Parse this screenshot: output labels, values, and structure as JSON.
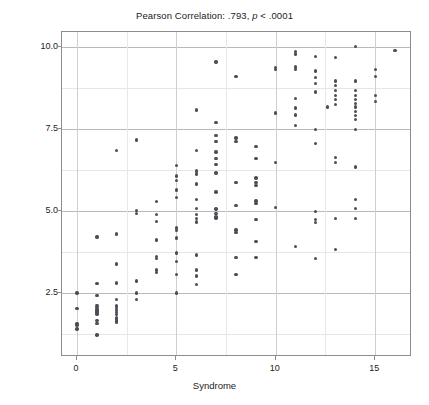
{
  "chart_data": {
    "type": "scatter",
    "title": "Pearson Correlation: .793, p < .0001",
    "title_parts": {
      "lead": "Pearson Correlation: .793,",
      "italic": "p",
      "tail": "< .0001"
    },
    "xlabel": "Syndrome",
    "ylabel": "Demographic Pressure",
    "xlim": [
      -0.75,
      16.85
    ],
    "ylim": [
      0.55,
      10.45
    ],
    "xticks": [
      0,
      5,
      10,
      15
    ],
    "xtick_labels": [
      "0",
      "5",
      "10",
      "15"
    ],
    "yticks": [
      2.5,
      5.0,
      7.5,
      10.0
    ],
    "ytick_labels": [
      "2.5",
      "5.0",
      "7.5",
      "10.0"
    ],
    "grid": true,
    "grid_axes": "both",
    "marker_color": "#4d4d55",
    "marker_size": 3.4,
    "frame_color": "#8c8c8c",
    "gridline_color": "#b9b9b9",
    "background": "#ffffff",
    "pearson_r": 0.793,
    "p_value": "< .0001",
    "n_points": 196,
    "points": [
      [
        0,
        2.5
      ],
      [
        0,
        2.02
      ],
      [
        0,
        1.58
      ],
      [
        0,
        1.52
      ],
      [
        0,
        1.4
      ],
      [
        1,
        4.2
      ],
      [
        1,
        2.78
      ],
      [
        1,
        2.42
      ],
      [
        1,
        2.12
      ],
      [
        1,
        2.06
      ],
      [
        1,
        2.0
      ],
      [
        1,
        1.97
      ],
      [
        1,
        1.94
      ],
      [
        1,
        1.9
      ],
      [
        1,
        1.86
      ],
      [
        1,
        1.66
      ],
      [
        1,
        1.58
      ],
      [
        1,
        1.22
      ],
      [
        2,
        6.84
      ],
      [
        2,
        4.3
      ],
      [
        2,
        3.38
      ],
      [
        2,
        2.8
      ],
      [
        2,
        2.3
      ],
      [
        2,
        2.1
      ],
      [
        2,
        2.02
      ],
      [
        2,
        1.96
      ],
      [
        2,
        1.9
      ],
      [
        2,
        1.84
      ],
      [
        2,
        1.74
      ],
      [
        2,
        1.68
      ],
      [
        2,
        1.62
      ],
      [
        3,
        7.16
      ],
      [
        3,
        5.02
      ],
      [
        3,
        4.92
      ],
      [
        3,
        2.86
      ],
      [
        3,
        2.5
      ],
      [
        3,
        2.3
      ],
      [
        4,
        5.28
      ],
      [
        4,
        4.9
      ],
      [
        4,
        4.68
      ],
      [
        4,
        4.12
      ],
      [
        4,
        3.62
      ],
      [
        4,
        3.56
      ],
      [
        4,
        3.2
      ],
      [
        4,
        3.12
      ],
      [
        5,
        6.38
      ],
      [
        5,
        6.06
      ],
      [
        5,
        5.92
      ],
      [
        5,
        5.64
      ],
      [
        5,
        5.4
      ],
      [
        5,
        4.48
      ],
      [
        5,
        4.4
      ],
      [
        5,
        4.18
      ],
      [
        5,
        3.72
      ],
      [
        5,
        3.46
      ],
      [
        5,
        3.06
      ],
      [
        5,
        2.5
      ],
      [
        6,
        8.08
      ],
      [
        6,
        6.84
      ],
      [
        6,
        6.22
      ],
      [
        6,
        6.12
      ],
      [
        6,
        5.82
      ],
      [
        6,
        5.34
      ],
      [
        6,
        5.08
      ],
      [
        6,
        4.9
      ],
      [
        6,
        4.76
      ],
      [
        6,
        4.66
      ],
      [
        6,
        3.66
      ],
      [
        6,
        3.2
      ],
      [
        6,
        3.02
      ],
      [
        6,
        2.76
      ],
      [
        7,
        9.54
      ],
      [
        7,
        7.7
      ],
      [
        7,
        7.3
      ],
      [
        7,
        7.12
      ],
      [
        7,
        6.8
      ],
      [
        7,
        6.6
      ],
      [
        7,
        6.42
      ],
      [
        7,
        6.16
      ],
      [
        7,
        5.58
      ],
      [
        7,
        5.06
      ],
      [
        7,
        4.92
      ],
      [
        7,
        4.82
      ],
      [
        7,
        4.78
      ],
      [
        8,
        9.1
      ],
      [
        8,
        7.22
      ],
      [
        8,
        7.12
      ],
      [
        8,
        5.86
      ],
      [
        8,
        5.16
      ],
      [
        8,
        4.42
      ],
      [
        8,
        4.34
      ],
      [
        8,
        3.58
      ],
      [
        8,
        3.06
      ],
      [
        9,
        6.96
      ],
      [
        9,
        6.6
      ],
      [
        9,
        6.0
      ],
      [
        9,
        5.86
      ],
      [
        9,
        5.78
      ],
      [
        9,
        5.3
      ],
      [
        9,
        5.22
      ],
      [
        9,
        4.74
      ],
      [
        9,
        4.06
      ],
      [
        9,
        3.58
      ],
      [
        10,
        9.36
      ],
      [
        10,
        9.3
      ],
      [
        10,
        7.98
      ],
      [
        10,
        6.48
      ],
      [
        10,
        5.1
      ],
      [
        11,
        9.86
      ],
      [
        11,
        9.78
      ],
      [
        11,
        9.38
      ],
      [
        11,
        9.3
      ],
      [
        11,
        8.42
      ],
      [
        11,
        8.14
      ],
      [
        11,
        7.92
      ],
      [
        11,
        7.6
      ],
      [
        11,
        3.92
      ],
      [
        12,
        9.7
      ],
      [
        12,
        9.26
      ],
      [
        12,
        9.06
      ],
      [
        12,
        8.88
      ],
      [
        12,
        8.62
      ],
      [
        12,
        7.48
      ],
      [
        12,
        7.06
      ],
      [
        12,
        4.98
      ],
      [
        12,
        4.74
      ],
      [
        12,
        4.64
      ],
      [
        12,
        3.56
      ],
      [
        12.6,
        8.16
      ],
      [
        13,
        9.68
      ],
      [
        13,
        8.96
      ],
      [
        13,
        8.82
      ],
      [
        13,
        8.66
      ],
      [
        13,
        8.52
      ],
      [
        13,
        8.4
      ],
      [
        13,
        8.24
      ],
      [
        13,
        6.62
      ],
      [
        13,
        6.48
      ],
      [
        13,
        4.76
      ],
      [
        13,
        3.82
      ],
      [
        14,
        10.0
      ],
      [
        14,
        8.96
      ],
      [
        14,
        8.66
      ],
      [
        14,
        8.52
      ],
      [
        14,
        8.4
      ],
      [
        14,
        8.28
      ],
      [
        14,
        8.16
      ],
      [
        14,
        8.02
      ],
      [
        14,
        7.9
      ],
      [
        14,
        7.78
      ],
      [
        14,
        7.48
      ],
      [
        14,
        6.34
      ],
      [
        14,
        5.34
      ],
      [
        14,
        5.08
      ],
      [
        14,
        4.76
      ],
      [
        15,
        9.3
      ],
      [
        15,
        9.1
      ],
      [
        15,
        8.52
      ],
      [
        15,
        8.34
      ],
      [
        16,
        9.88
      ]
    ]
  }
}
